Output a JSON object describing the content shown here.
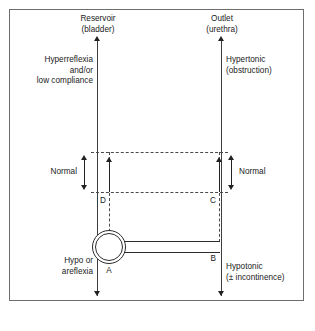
{
  "figure": {
    "title_left": "Reservoir\n(bladder)",
    "title_right": "Outlet\n(urethra)",
    "axis_left_top_text": "Hyperreflexia\nand/or\nlow compliance",
    "axis_left_bottom_text": "Hypo or\nareflexia",
    "axis_right_top_text": "Hypertonic\n(obstruction)",
    "axis_right_bottom_text": "Hypotonic\n(± incontinence)",
    "normal_left_label": "Normal",
    "normal_right_label": "Normal",
    "point_a": "A",
    "point_b": "B",
    "point_c": "C",
    "point_d": "D",
    "colors": {
      "line": "#2b2b2b",
      "dashed": "#4a4a4a",
      "frame": "#6e6e6e",
      "text": "#1a1a1a",
      "background": "#ffffff"
    }
  }
}
